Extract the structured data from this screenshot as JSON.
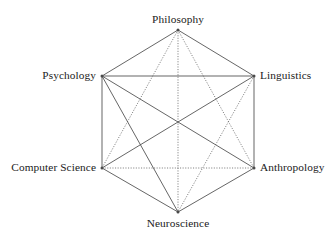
{
  "figure": {
    "background_color": "#ffffff",
    "line_color": "#4a4a4a",
    "text_color": "#1a1a1a"
  },
  "chart_data": {
    "type": "diagram",
    "subtype": "complete-graph-hexagon",
    "title": "",
    "node_count": 6,
    "edge_count": 15,
    "nodes": [
      {
        "id": "philosophy",
        "label": "Philosophy",
        "x": 178,
        "y": 30,
        "label_position": "above"
      },
      {
        "id": "psychology",
        "label": "Psychology",
        "x": 102,
        "y": 76,
        "label_position": "left"
      },
      {
        "id": "linguistics",
        "label": "Linguistics",
        "x": 254,
        "y": 76,
        "label_position": "right"
      },
      {
        "id": "computer-science",
        "label": "Computer Science",
        "x": 102,
        "y": 168,
        "label_position": "left"
      },
      {
        "id": "anthropology",
        "label": "Anthropology",
        "x": 254,
        "y": 168,
        "label_position": "right"
      },
      {
        "id": "neuroscience",
        "label": "Neuroscience",
        "x": 178,
        "y": 212,
        "label_position": "below"
      }
    ],
    "edges": [
      {
        "from": "philosophy",
        "to": "psychology",
        "style": "solid",
        "kind": "perimeter"
      },
      {
        "from": "philosophy",
        "to": "linguistics",
        "style": "solid",
        "kind": "perimeter"
      },
      {
        "from": "psychology",
        "to": "computer-science",
        "style": "solid",
        "kind": "perimeter"
      },
      {
        "from": "linguistics",
        "to": "anthropology",
        "style": "solid",
        "kind": "perimeter"
      },
      {
        "from": "computer-science",
        "to": "neuroscience",
        "style": "solid",
        "kind": "perimeter"
      },
      {
        "from": "anthropology",
        "to": "neuroscience",
        "style": "solid",
        "kind": "perimeter"
      },
      {
        "from": "psychology",
        "to": "linguistics",
        "style": "solid",
        "kind": "diagonal"
      },
      {
        "from": "psychology",
        "to": "anthropology",
        "style": "solid",
        "kind": "diagonal"
      },
      {
        "from": "psychology",
        "to": "neuroscience",
        "style": "solid",
        "kind": "diagonal"
      },
      {
        "from": "linguistics",
        "to": "computer-science",
        "style": "solid",
        "kind": "diagonal"
      },
      {
        "from": "linguistics",
        "to": "neuroscience",
        "style": "dotted",
        "kind": "diagonal"
      },
      {
        "from": "philosophy",
        "to": "computer-science",
        "style": "dotted",
        "kind": "diagonal"
      },
      {
        "from": "philosophy",
        "to": "neuroscience",
        "style": "dotted",
        "kind": "diagonal"
      },
      {
        "from": "philosophy",
        "to": "anthropology",
        "style": "dotted",
        "kind": "diagonal"
      },
      {
        "from": "computer-science",
        "to": "anthropology",
        "style": "dotted",
        "kind": "diagonal"
      }
    ]
  }
}
